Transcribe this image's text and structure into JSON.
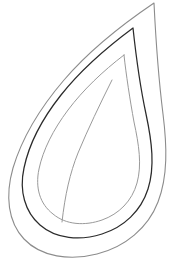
{
  "document": {
    "title": "Leaf Outline Drawing",
    "type": "line-art",
    "subject": "leaf",
    "background_color": "#ffffff",
    "width": 171,
    "height": 261,
    "text_content": "",
    "has_text": false
  },
  "drawing": {
    "description": "Teardrop / pointed-oval leaf shape drawn as three nested outlines with a single curved midrib vein line. No text, no labels, no color fill.",
    "style": "coloring-page outline",
    "fill": "none",
    "strokes": [
      {
        "name": "outer-leaf-outline",
        "color": "#8c8c8c",
        "width": 1.1,
        "role": "outermost silhouette",
        "path": "M 154 3 C 120 26 88 52 64 80 C 40 108 22 138 13 168 C 5 196 8 222 24 239 C 41 257 70 261 97 254 C 125 247 148 228 158 202 C 168 176 167 146 163 114 C 159 82 156 44 154 3 Z"
      },
      {
        "name": "middle-leaf-outline",
        "color": "#2b2b2b",
        "width": 1.25,
        "role": "primary dark leaf edge",
        "path": "M 133 28 C 106 48 80 71 61 95 C 42 119 29 144 24 168 C 19 191 25 212 40 225 C 56 239 80 241 102 234 C 124 227 141 211 148 189 C 155 167 152 142 146 114 C 140 86 136 56 133 28 Z"
      },
      {
        "name": "inner-leaf-outline",
        "color": "#9a9a9a",
        "width": 1.0,
        "role": "inner contour band",
        "path": "M 124 55 C 103 71 83 90 68 110 C 53 130 43 150 39 169 C 35 188 40 204 53 214 C 66 225 85 226 102 220 C 119 214 132 201 137 183 C 142 165 139 145 134 122 C 130 100 126 74 124 55 Z"
      },
      {
        "name": "midrib-vein-line",
        "color": "#9a9a9a",
        "width": 1.0,
        "role": "central vein",
        "path": "M 112 80 C 100 104 88 129 78 153 C 70 173 65 195 62 222"
      }
    ]
  },
  "colors": {
    "background": "#ffffff",
    "outline_light": "#8c8c8c",
    "outline_dark": "#2b2b2b",
    "outline_inner": "#9a9a9a"
  }
}
